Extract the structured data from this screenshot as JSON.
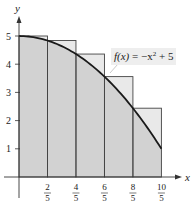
{
  "chart_data": {
    "type": "area",
    "title": "",
    "function_label": "f(x) = −x² + 5",
    "function_label_parts": {
      "fx": "f(x)",
      "eq": " = −x",
      "sup": "2",
      "rest": " + 5"
    },
    "xlabel": "x",
    "ylabel": "y",
    "xlim": [
      0,
      2
    ],
    "ylim": [
      0,
      5
    ],
    "x_ticks": [
      {
        "num": "2",
        "den": "5",
        "value": 0.4
      },
      {
        "num": "4",
        "den": "5",
        "value": 0.8
      },
      {
        "num": "6",
        "den": "5",
        "value": 1.2
      },
      {
        "num": "8",
        "den": "5",
        "value": 1.6
      },
      {
        "num": "10",
        "den": "5",
        "value": 2.0
      }
    ],
    "y_ticks": [
      "1",
      "2",
      "3",
      "4",
      "5"
    ],
    "curve": {
      "expression": "-x^2 + 5",
      "x": [
        0,
        0.2,
        0.4,
        0.6,
        0.8,
        1.0,
        1.2,
        1.4,
        1.6,
        1.8,
        2.0
      ],
      "y": [
        5,
        4.96,
        4.84,
        4.64,
        4.36,
        4,
        3.56,
        3.04,
        2.44,
        1.76,
        1
      ]
    },
    "rectangles": {
      "kind": "upper sum (left endpoints)",
      "width": 0.4,
      "x_left": [
        0,
        0.4,
        0.8,
        1.2,
        1.6
      ],
      "heights": [
        5,
        4.84,
        4.36,
        3.56,
        2.44
      ]
    },
    "grid": false,
    "legend": "none"
  },
  "colors": {
    "under_curve": "#d2d2d2",
    "excess_area": "#e9e9e9",
    "stroke": "#1a1a1a",
    "label_bg": "#eeeeee"
  }
}
